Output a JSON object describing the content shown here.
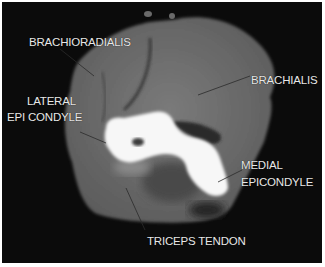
{
  "image": {
    "type": "axial CT scan of elbow",
    "labels": [
      {
        "id": "brachioradialis",
        "text": "BRACHIORADIALIS"
      },
      {
        "id": "brachialis",
        "text": "BRACHIALIS"
      },
      {
        "id": "lateral-epicondyle",
        "line1": "LATERAL",
        "line2": "EPI CONDYLE"
      },
      {
        "id": "medial-epicondyle",
        "line1": "MEDIAL",
        "line2": "EPICONDYLE"
      },
      {
        "id": "triceps-tendon",
        "text": "TRICEPS TENDON"
      }
    ]
  }
}
